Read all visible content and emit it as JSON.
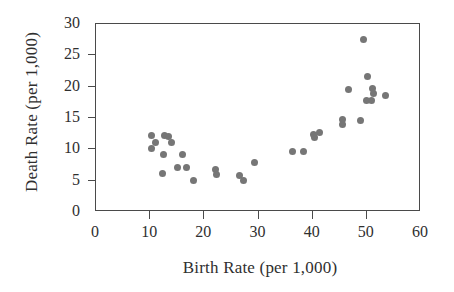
{
  "chart_data": {
    "type": "scatter",
    "title": "",
    "xlabel": "Birth Rate (per 1,000)",
    "ylabel": "Death Rate (per 1,000)",
    "xlim": [
      0,
      60
    ],
    "ylim": [
      0,
      30
    ],
    "xticks": [
      0,
      10,
      20,
      30,
      40,
      50,
      60
    ],
    "yticks": [
      0,
      5,
      10,
      15,
      20,
      25,
      30
    ],
    "xtick_labels": [
      "0",
      "10",
      "20",
      "30",
      "40",
      "50",
      "60"
    ],
    "ytick_labels": [
      "0",
      "5",
      "10",
      "15",
      "20",
      "25",
      "30"
    ],
    "grid": false,
    "legend": false,
    "marker": {
      "shape": "circle",
      "color": "#767676",
      "size": 7
    },
    "series": [
      {
        "name": "Countries",
        "points": [
          [
            10.5,
            12.0
          ],
          [
            10.5,
            10.0
          ],
          [
            11.2,
            11.0
          ],
          [
            12.8,
            12.0
          ],
          [
            13.5,
            11.9
          ],
          [
            14.2,
            11.0
          ],
          [
            12.7,
            9.0
          ],
          [
            16.1,
            9.0
          ],
          [
            12.4,
            6.0
          ],
          [
            15.3,
            7.0
          ],
          [
            16.8,
            7.0
          ],
          [
            18.2,
            4.8
          ],
          [
            22.3,
            6.6
          ],
          [
            22.4,
            5.8
          ],
          [
            26.6,
            5.7
          ],
          [
            27.4,
            4.8
          ],
          [
            29.4,
            7.7
          ],
          [
            36.4,
            9.5
          ],
          [
            38.5,
            9.5
          ],
          [
            40.3,
            12.2
          ],
          [
            40.5,
            11.8
          ],
          [
            41.4,
            12.5
          ],
          [
            45.6,
            14.6
          ],
          [
            45.7,
            13.8
          ],
          [
            46.8,
            19.4
          ],
          [
            49.1,
            14.5
          ],
          [
            49.5,
            27.4
          ],
          [
            50.2,
            17.6
          ],
          [
            50.3,
            21.5
          ],
          [
            51.1,
            17.6
          ],
          [
            51.3,
            19.5
          ],
          [
            51.4,
            18.7
          ],
          [
            53.6,
            18.4
          ]
        ]
      }
    ]
  }
}
